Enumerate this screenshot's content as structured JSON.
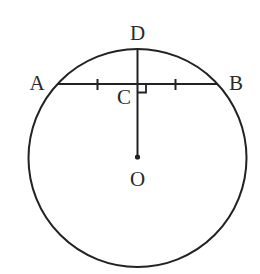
{
  "diagram": {
    "type": "geometry",
    "colors": {
      "stroke": "#222222",
      "label": "#2a2a2a",
      "background": "#ffffff"
    },
    "circle": {
      "cx": 137.5,
      "cy": 158,
      "r": 109
    },
    "points": {
      "A": {
        "label": "A",
        "x": 57.5,
        "y": 84
      },
      "B": {
        "label": "B",
        "x": 217.5,
        "y": 84
      },
      "C": {
        "label": "C",
        "x": 137.5,
        "y": 84
      },
      "D": {
        "label": "D",
        "x": 137.5,
        "y": 49
      },
      "O": {
        "label": "O",
        "x": 137.5,
        "y": 158
      }
    },
    "segments": [
      {
        "name": "chord-AB",
        "from": "A",
        "to": "B"
      },
      {
        "name": "segment-DO",
        "from": "D",
        "to": "O"
      }
    ],
    "markings": {
      "equal_ticks": [
        "AC",
        "CB"
      ],
      "right_angle_at": "C"
    }
  }
}
